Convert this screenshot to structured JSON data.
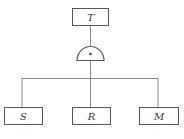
{
  "diagram": {
    "type": "fault-tree",
    "top_event": {
      "label": "T",
      "x": 72,
      "y": 8,
      "w": 36,
      "h": 17
    },
    "gate": {
      "type": "AND",
      "symbol": "•",
      "cx": 90.5,
      "base_y": 60,
      "rx": 13.5,
      "ry": 14
    },
    "bus": {
      "y": 78,
      "x1": 22,
      "x2": 158
    },
    "basic_events": [
      {
        "label": "S",
        "x": 4,
        "y": 107,
        "w": 38,
        "h": 17,
        "cx": 22
      },
      {
        "label": "R",
        "x": 72,
        "y": 107,
        "w": 38,
        "h": 17,
        "cx": 91
      },
      {
        "label": "M",
        "x": 139,
        "y": 107,
        "w": 39,
        "h": 17,
        "cx": 158
      }
    ],
    "colors": {
      "stroke": "#555555",
      "line": "#888888",
      "text": "#333333",
      "background": "#ffffff"
    }
  }
}
